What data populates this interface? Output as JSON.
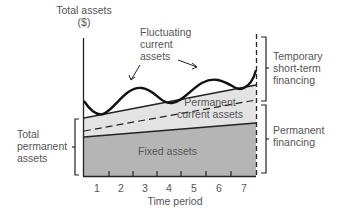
{
  "diagram": {
    "y_axis_label_line1": "Total assets",
    "y_axis_label_line2": "($)",
    "x_axis_label": "Time period",
    "x_ticks": [
      "1",
      "2",
      "3",
      "4",
      "5",
      "6",
      "7"
    ],
    "regions": {
      "fluctuating_line1": "Fluctuating",
      "fluctuating_line2": "current",
      "fluctuating_line3": "assets",
      "permanent_current_line1": "Permanent",
      "permanent_current_line2": "current assets",
      "fixed": "Fixed assets"
    },
    "left_bracket": {
      "line1": "Total",
      "line2": "permanent",
      "line3": "assets"
    },
    "right_brackets": {
      "temporary_line1": "Temporary",
      "temporary_line2": "short-term",
      "temporary_line3": "financing",
      "permanent_line1": "Permanent",
      "permanent_line2": "financing"
    },
    "colors": {
      "fixed_fill": "#b4b4b4",
      "permanent_current_fill": "#e2e2e2",
      "line": "#1a1a1a"
    }
  }
}
